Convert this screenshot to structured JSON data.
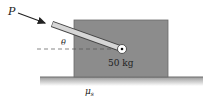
{
  "diagram": {
    "force_label": "P",
    "angle_label": "θ",
    "mass_label": "50 kg",
    "friction_label": "μ",
    "friction_subscript": "s",
    "colors": {
      "block": "#8c8c8c",
      "block_border": "#5a5a5a",
      "rod": "#d4d4d4",
      "rod_border": "#444444",
      "ground": "#6e6e6e",
      "text": "#222222"
    }
  }
}
